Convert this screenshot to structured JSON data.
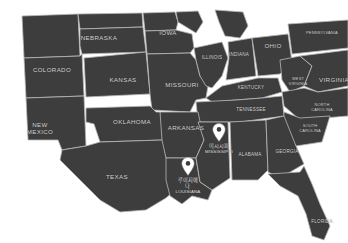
{
  "map": {
    "background_color": "#ffffff",
    "state_fill_color": "#3d3d3d",
    "state_border_color": "#b9b9b9",
    "label_color": "#d6d6d6",
    "marker_color": "#ffffff",
    "region": "Central and Southeastern United States",
    "states": [
      {
        "name": "COLORADO",
        "x": 52,
        "y": 70,
        "size": "md"
      },
      {
        "name": "NEBRASKA",
        "x": 99,
        "y": 38,
        "size": "md"
      },
      {
        "name": "KANSAS",
        "x": 123,
        "y": 80,
        "size": "md"
      },
      {
        "name": "IOWA",
        "x": 168,
        "y": 33,
        "size": "md"
      },
      {
        "name": "MISSOURI",
        "x": 182,
        "y": 85,
        "size": "md"
      },
      {
        "name": "ILLINOIS",
        "x": 212,
        "y": 58,
        "size": "sm"
      },
      {
        "name": "INDIANA",
        "x": 239,
        "y": 55,
        "size": "sm"
      },
      {
        "name": "OHIO",
        "x": 273,
        "y": 46,
        "size": "md"
      },
      {
        "name": "PENNSYLVANIA",
        "x": 322,
        "y": 33,
        "size": "xs"
      },
      {
        "name": "KENTUCKY",
        "x": 251,
        "y": 88,
        "size": "sm"
      },
      {
        "name": "WEST\nVIRGINIA",
        "x": 298,
        "y": 82,
        "size": "xs"
      },
      {
        "name": "VIRGINIA",
        "x": 334,
        "y": 80,
        "size": "md"
      },
      {
        "name": "TENNESSEE",
        "x": 251,
        "y": 110,
        "size": "sm"
      },
      {
        "name": "NORTH\nCAROLINA",
        "x": 322,
        "y": 108,
        "size": "xs"
      },
      {
        "name": "SOUTH\nCAROLINA",
        "x": 310,
        "y": 129,
        "size": "xs"
      },
      {
        "name": "GEORGIA",
        "x": 287,
        "y": 152,
        "size": "sm"
      },
      {
        "name": "ALABAMA",
        "x": 250,
        "y": 155,
        "size": "sm"
      },
      {
        "name": "ARKANSAS",
        "x": 186,
        "y": 128,
        "size": "md"
      },
      {
        "name": "OKLAHOMA",
        "x": 132,
        "y": 122,
        "size": "md"
      },
      {
        "name": "NEW\nMEXICO",
        "x": 40,
        "y": 128,
        "size": "md"
      },
      {
        "name": "TEXAS",
        "x": 117,
        "y": 177,
        "size": "md"
      },
      {
        "name": "FLORIDA",
        "x": 322,
        "y": 222,
        "size": "sm"
      }
    ],
    "markers": [
      {
        "id": "marker-mississippi",
        "label_ko": "미시시피",
        "label_en": "MISSISSIPPI",
        "x": 219,
        "y": 142
      },
      {
        "id": "marker-louisiana",
        "label_ko": "루이지애나",
        "label_en": "LOUISIANA",
        "x": 188,
        "y": 176
      }
    ]
  }
}
